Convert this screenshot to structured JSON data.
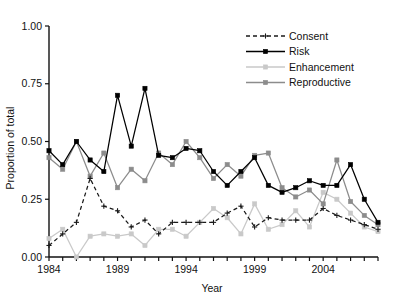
{
  "chart_data": {
    "type": "line",
    "title": "",
    "xlabel": "Year",
    "ylabel": "Proportion of total",
    "xlim": [
      1984,
      2008
    ],
    "ylim": [
      0.0,
      1.0
    ],
    "grid": false,
    "legend_position": "top-right",
    "x": [
      1984,
      1985,
      1986,
      1987,
      1988,
      1989,
      1990,
      1991,
      1992,
      1993,
      1994,
      1995,
      1996,
      1997,
      1998,
      1999,
      2000,
      2001,
      2002,
      2003,
      2004,
      2005,
      2006,
      2007,
      2008
    ],
    "y_ticks": [
      0.0,
      0.25,
      0.5,
      0.75,
      1.0
    ],
    "y_tick_labels": [
      "0.00",
      "0.25",
      "0.50",
      "0.75",
      "1.00"
    ],
    "x_ticks": [
      1984,
      1985,
      1986,
      1987,
      1988,
      1989,
      1990,
      1991,
      1992,
      1993,
      1994,
      1995,
      1996,
      1997,
      1998,
      1999,
      2000,
      2001,
      2002,
      2003,
      2004,
      2005,
      2006,
      2007,
      2008
    ],
    "x_tick_labels_shown": [
      "1984",
      "1989",
      "1994",
      "1999",
      "2004"
    ],
    "x_tick_labels_shown_at": [
      1984,
      1989,
      1994,
      1999,
      2004
    ],
    "series": [
      {
        "name": "Consent",
        "color": "#1a1a1a",
        "marker": "plus",
        "dash": "4,3",
        "values": [
          0.05,
          0.1,
          0.15,
          0.34,
          0.22,
          0.2,
          0.13,
          0.16,
          0.1,
          0.15,
          0.15,
          0.15,
          0.15,
          0.19,
          0.22,
          0.13,
          0.17,
          0.16,
          0.16,
          0.16,
          0.21,
          0.18,
          0.16,
          0.14,
          0.12
        ]
      },
      {
        "name": "Risk",
        "color": "#000000",
        "marker": "square",
        "dash": "",
        "values": [
          0.46,
          0.4,
          0.5,
          0.42,
          0.37,
          0.7,
          0.48,
          0.73,
          0.44,
          0.43,
          0.47,
          0.46,
          0.37,
          0.31,
          0.37,
          0.43,
          0.31,
          0.28,
          0.3,
          0.33,
          0.31,
          0.31,
          0.4,
          0.25,
          0.15
        ]
      },
      {
        "name": "Enhancement",
        "color": "#c9c9c9",
        "marker": "square",
        "dash": "",
        "values": [
          0.08,
          0.12,
          0.0,
          0.09,
          0.1,
          0.09,
          0.1,
          0.05,
          0.12,
          0.12,
          0.09,
          0.15,
          0.21,
          0.17,
          0.1,
          0.23,
          0.12,
          0.14,
          0.2,
          0.13,
          0.28,
          0.25,
          0.19,
          0.13,
          0.11
        ]
      },
      {
        "name": "Reproductive",
        "color": "#8c8c8c",
        "marker": "square",
        "dash": "",
        "values": [
          0.43,
          0.38,
          0.5,
          0.35,
          0.45,
          0.3,
          0.38,
          0.33,
          0.45,
          0.4,
          0.5,
          0.43,
          0.34,
          0.4,
          0.35,
          0.44,
          0.45,
          0.3,
          0.26,
          0.29,
          0.23,
          0.42,
          0.24,
          0.18,
          0.14
        ]
      }
    ]
  },
  "axes": {
    "y_label": "Proportion of total",
    "x_label": "Year"
  },
  "legend": {
    "items": [
      {
        "label": "Consent"
      },
      {
        "label": "Risk"
      },
      {
        "label": "Enhancement"
      },
      {
        "label": "Reproductive"
      }
    ]
  }
}
